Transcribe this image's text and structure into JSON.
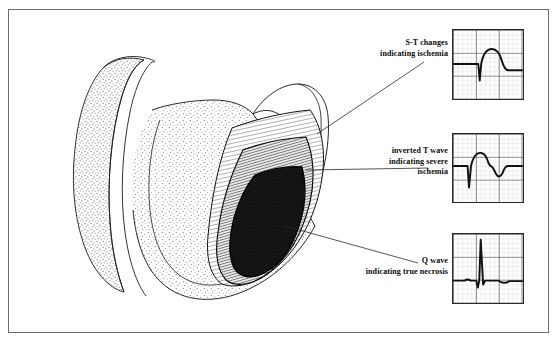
{
  "figure": {
    "border_color": "#6d6d6d",
    "background": "#ffffff",
    "width": 559,
    "height": 343
  },
  "annotations": [
    {
      "id": "st-changes",
      "text": "S-T changes\nindicating ischemia",
      "line1": "S-T changes",
      "line2": "indicating ischemia",
      "points_to": "ischemic-zone",
      "ecg": "ecg-st-changes"
    },
    {
      "id": "inverted-t",
      "text": "inverted T wave\nindicating severe\nischemia",
      "line1": "inverted T wave",
      "line2": "indicating severe",
      "line3": "ischemia",
      "points_to": "injury-zone",
      "ecg": "ecg-inverted-t"
    },
    {
      "id": "q-wave",
      "text": "Q wave\nindicating true necrosis",
      "line1": "Q wave",
      "line2": "indicating true necrosis",
      "points_to": "necrosis-zone",
      "ecg": "ecg-q-wave"
    }
  ],
  "anatomy": {
    "organ": "heart-myocardium-cross-section",
    "shading": "stipple",
    "zones": [
      {
        "id": "ischemic-zone",
        "label": "zone of ischemia",
        "texture": "light-hatched",
        "color": "#f2f2f2"
      },
      {
        "id": "injury-zone",
        "label": "zone of injury",
        "texture": "medium-hatched",
        "color": "#9a9a9a"
      },
      {
        "id": "necrosis-zone",
        "label": "zone of necrosis",
        "texture": "dense-stipple",
        "color": "#2b2b2b"
      }
    ]
  },
  "ecg_traces": [
    {
      "id": "ecg-st-changes",
      "name": "S-T segment elevation",
      "grid": {
        "minor_px": 5,
        "major_every": 5,
        "minor_color": "#b9b9b9",
        "major_color": "#3a3a3a"
      },
      "trace_color": "#111111"
    },
    {
      "id": "ecg-inverted-t",
      "name": "Inverted T wave",
      "grid": {
        "minor_px": 5,
        "major_every": 5,
        "minor_color": "#b9b9b9",
        "major_color": "#3a3a3a"
      },
      "trace_color": "#111111"
    },
    {
      "id": "ecg-q-wave",
      "name": "Pathological Q wave with tall R",
      "grid": {
        "minor_px": 5,
        "major_every": 5,
        "minor_color": "#b9b9b9",
        "major_color": "#3a3a3a"
      },
      "trace_color": "#111111"
    }
  ]
}
